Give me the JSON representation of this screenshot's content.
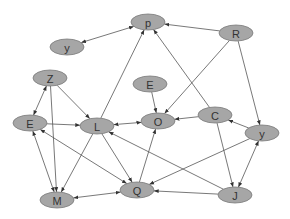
{
  "diagram": {
    "type": "directed-graph",
    "colors": {
      "node_fill": "#a6a6a6",
      "node_stroke": "#7a7a7a",
      "edge": "#555555",
      "label": "#333333",
      "background": "#ffffff"
    },
    "nodes": [
      {
        "id": "p",
        "label": "p",
        "x": 148,
        "y": 22
      },
      {
        "id": "y1",
        "label": "y",
        "x": 67,
        "y": 47
      },
      {
        "id": "R",
        "label": "R",
        "x": 236,
        "y": 33
      },
      {
        "id": "Z",
        "label": "Z",
        "x": 50,
        "y": 78
      },
      {
        "id": "E1",
        "label": "E",
        "x": 150,
        "y": 84
      },
      {
        "id": "E2",
        "label": "E",
        "x": 30,
        "y": 123
      },
      {
        "id": "L",
        "label": "L",
        "x": 97,
        "y": 126
      },
      {
        "id": "O",
        "label": "O",
        "x": 158,
        "y": 121
      },
      {
        "id": "C",
        "label": "C",
        "x": 215,
        "y": 115
      },
      {
        "id": "y2",
        "label": "y",
        "x": 262,
        "y": 133
      },
      {
        "id": "M",
        "label": "M",
        "x": 57,
        "y": 200
      },
      {
        "id": "Q",
        "label": "Q",
        "x": 137,
        "y": 190
      },
      {
        "id": "J",
        "label": "J",
        "x": 235,
        "y": 195
      }
    ],
    "edges": [
      {
        "from": "p",
        "to": "y1",
        "bidirectional": true
      },
      {
        "from": "R",
        "to": "p"
      },
      {
        "from": "L",
        "to": "p"
      },
      {
        "from": "C",
        "to": "p"
      },
      {
        "from": "R",
        "to": "O"
      },
      {
        "from": "R",
        "to": "y2"
      },
      {
        "from": "Z",
        "to": "E2",
        "bidirectional": true
      },
      {
        "from": "Z",
        "to": "M"
      },
      {
        "from": "Z",
        "to": "L"
      },
      {
        "from": "E2",
        "to": "L"
      },
      {
        "from": "E2",
        "to": "M",
        "bidirectional": true
      },
      {
        "from": "Q",
        "to": "E2",
        "bidirectional": true
      },
      {
        "from": "L",
        "to": "O",
        "bidirectional": true
      },
      {
        "from": "L",
        "to": "M"
      },
      {
        "from": "L",
        "to": "Q"
      },
      {
        "from": "E1",
        "to": "O"
      },
      {
        "from": "C",
        "to": "O"
      },
      {
        "from": "y2",
        "to": "C"
      },
      {
        "from": "C",
        "to": "J"
      },
      {
        "from": "y2",
        "to": "J",
        "bidirectional": true
      },
      {
        "from": "y2",
        "to": "Q"
      },
      {
        "from": "J",
        "to": "Q"
      },
      {
        "from": "Q",
        "to": "O"
      },
      {
        "from": "M",
        "to": "Q",
        "bidirectional": true
      },
      {
        "from": "J",
        "to": "L"
      }
    ]
  }
}
